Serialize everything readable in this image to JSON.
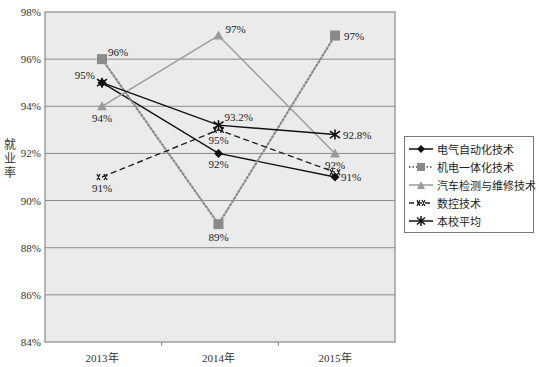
{
  "chart_data": {
    "type": "line",
    "title": "",
    "xlabel": "",
    "ylabel": "就业率",
    "categories": [
      "2013年",
      "2014年",
      "2015年"
    ],
    "ylim": [
      84,
      98
    ],
    "yticks": [
      "84%",
      "86%",
      "88%",
      "90%",
      "92%",
      "94%",
      "96%",
      "98%"
    ],
    "grid": true,
    "legend_position": "right",
    "series": [
      {
        "name": "电气自动化技术",
        "values": [
          95,
          92,
          91
        ],
        "labels": [
          "95%",
          "92%",
          "91%"
        ],
        "color": "#111111",
        "style": "solid",
        "marker": "diamond"
      },
      {
        "name": "机电一体化技术",
        "values": [
          96,
          89,
          97
        ],
        "labels": [
          "96%",
          "89%",
          "97%"
        ],
        "color": "#8a8a8a",
        "style": "dotted",
        "marker": "square"
      },
      {
        "name": "汽车检测与维修技术",
        "values": [
          94,
          97,
          92
        ],
        "labels": [
          "94%",
          "97%",
          "92%"
        ],
        "color": "#9a9a9a",
        "style": "solid",
        "marker": "triangle"
      },
      {
        "name": "数控技术",
        "values": [
          91,
          93,
          91.2
        ],
        "labels": [
          "91%",
          "95%",
          ""
        ],
        "color": "#222222",
        "style": "dashed",
        "marker": "double-cross"
      },
      {
        "name": "本校平均",
        "values": [
          95,
          93.2,
          92.8
        ],
        "labels": [
          "",
          "93.2%",
          "92.8%"
        ],
        "color": "#111111",
        "style": "solid",
        "marker": "asterisk"
      }
    ]
  },
  "axis": {
    "y_title": "就业率"
  },
  "legend": {
    "items": [
      "电气自动化技术",
      "机电一体化技术",
      "汽车检测与维修技术",
      "数控技术",
      "本校平均"
    ]
  }
}
